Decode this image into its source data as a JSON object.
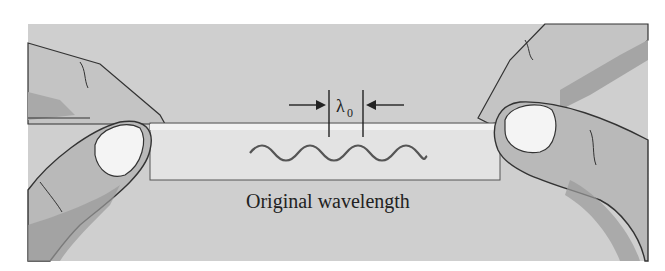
{
  "figure": {
    "caption": "Original wavelength",
    "symbol": "λ",
    "symbol_subscript": "0",
    "colors": {
      "panel": "#cfcfcf",
      "band": "#e3e3e3",
      "band_highlight": "#f2f2f2",
      "skin": "#b9b9b9",
      "skin_shadow": "#9a9a9a",
      "nail": "#f4f4f4",
      "outline": "#333333",
      "wave": "#555555"
    }
  }
}
